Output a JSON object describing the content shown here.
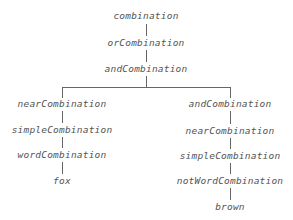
{
  "diagram": {
    "type": "parse-tree",
    "root": {
      "label": "combination",
      "child": {
        "label": "orCombination",
        "child": {
          "label": "andCombination",
          "children": [
            {
              "label": "nearCombination",
              "chain": [
                "nearCombination",
                "simpleCombination",
                "wordCombination",
                "fox"
              ]
            },
            {
              "label": "andCombination",
              "chain": [
                "andCombination",
                "nearCombination",
                "simpleCombination",
                "notWordCombination",
                "brown"
              ]
            }
          ]
        }
      }
    },
    "nodes": {
      "n0": "combination",
      "n1": "orCombination",
      "n2": "andCombination",
      "l0": "nearCombination",
      "l1": "simpleCombination",
      "l2": "wordCombination",
      "l3": "fox",
      "r0": "andCombination",
      "r1": "nearCombination",
      "r2": "simpleCombination",
      "r3": "notWordCombination",
      "r4": "brown"
    },
    "colors": {
      "text": "#555555",
      "edge": "#666666",
      "background": "#ffffff"
    }
  }
}
